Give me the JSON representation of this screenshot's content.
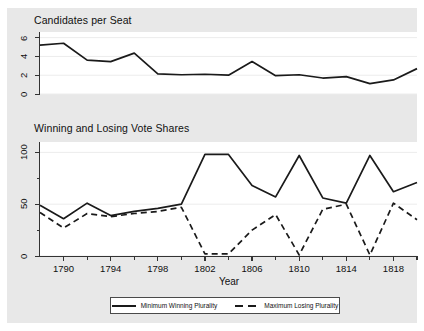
{
  "figure": {
    "background": "#e8e8e8",
    "plot_background": "#ffffff",
    "line_color": "#1a1a1a"
  },
  "panels": [
    {
      "id": "candidates-per-seat",
      "title": "Candidates per Seat"
    },
    {
      "id": "vote-shares",
      "title": "Winning and Losing Vote Shares"
    }
  ],
  "legend": {
    "entries": [
      {
        "label": "Minimum Winning Plurality",
        "style": "solid"
      },
      {
        "label": "Maximum Losing Plurality",
        "style": "dashed"
      }
    ]
  },
  "chart_data": [
    {
      "type": "line",
      "title": "Candidates per Seat",
      "xlabel": "",
      "ylabel": "",
      "xlim": [
        1788,
        1820
      ],
      "ylim": [
        0,
        6.6
      ],
      "yticks": [
        0,
        2,
        4,
        6
      ],
      "ytick_labels": [
        "0",
        "2",
        "4",
        "6"
      ],
      "xticks": [
        1790,
        1794,
        1798,
        1802,
        1806,
        1810,
        1814,
        1818
      ],
      "xtick_labels": [
        "1790",
        "1794",
        "1798",
        "1802",
        "1806",
        "1810",
        "1814",
        "1818"
      ],
      "xticks_minor": [
        1792,
        1796,
        1800,
        1804,
        1808,
        1812,
        1816,
        1820
      ],
      "grid": true,
      "series": [
        {
          "name": "Candidates per Seat",
          "style": "solid",
          "x": [
            1788,
            1790,
            1792,
            1794,
            1796,
            1798,
            1800,
            1802,
            1804,
            1806,
            1808,
            1810,
            1812,
            1814,
            1816,
            1818,
            1820
          ],
          "values": [
            5.2,
            5.4,
            3.6,
            3.45,
            4.35,
            2.15,
            2.05,
            2.1,
            2.0,
            3.45,
            1.95,
            2.05,
            1.7,
            1.85,
            1.1,
            1.5,
            2.7
          ]
        }
      ]
    },
    {
      "type": "line",
      "title": "Winning and Losing Vote Shares",
      "xlabel": "Year",
      "ylabel": "",
      "xlim": [
        1788,
        1820
      ],
      "ylim": [
        0,
        110
      ],
      "yticks": [
        0,
        50,
        100
      ],
      "ytick_labels": [
        "0",
        "50",
        "100"
      ],
      "yticks_minor": [
        25,
        75
      ],
      "xticks": [
        1790,
        1794,
        1798,
        1802,
        1806,
        1810,
        1814,
        1818
      ],
      "xtick_labels": [
        "1790",
        "1794",
        "1798",
        "1802",
        "1806",
        "1810",
        "1814",
        "1818"
      ],
      "xticks_minor": [
        1792,
        1796,
        1800,
        1804,
        1808,
        1812,
        1816,
        1820
      ],
      "grid": true,
      "series": [
        {
          "name": "Minimum Winning Plurality",
          "style": "solid",
          "x": [
            1788,
            1790,
            1792,
            1794,
            1796,
            1798,
            1800,
            1802,
            1804,
            1806,
            1808,
            1810,
            1812,
            1814,
            1816,
            1818,
            1820
          ],
          "values": [
            49,
            36,
            51,
            39,
            43,
            46,
            50,
            98,
            98,
            68,
            57,
            97,
            56,
            51,
            97,
            62,
            71
          ]
        },
        {
          "name": "Maximum Losing Plurality",
          "style": "dashed",
          "x": [
            1788,
            1790,
            1792,
            1794,
            1796,
            1798,
            1800,
            1802,
            1804,
            1806,
            1808,
            1810,
            1812,
            1814,
            1816,
            1818,
            1820
          ],
          "values": [
            42,
            27,
            41,
            38,
            41,
            43,
            47,
            2,
            2,
            25,
            40,
            1,
            45,
            50,
            1,
            51,
            35
          ]
        }
      ]
    }
  ]
}
